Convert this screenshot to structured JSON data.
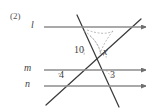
{
  "figure": {
    "problem_number": "(2)",
    "colors": {
      "parallel_line": "#8c8c8c",
      "transversal": "#3c3c3c",
      "arc": "#9a9a9a",
      "text": "#3f3f3f",
      "background": "#ffffff"
    },
    "parallel_lines": [
      {
        "name": "l",
        "label": "l",
        "y": 27,
        "x_start": 44,
        "x_end": 146,
        "arrow": "right"
      },
      {
        "name": "m",
        "label": "m",
        "y": 70,
        "x_start": 44,
        "x_end": 146,
        "arrow": "right"
      },
      {
        "name": "n",
        "label": "n",
        "y": 86,
        "x_start": 44,
        "x_end": 146,
        "arrow": "right"
      }
    ],
    "transversals": [
      {
        "name": "transversal-left",
        "x1": 77,
        "y1": 15,
        "x2": 119,
        "y2": 107,
        "direction": "down-right"
      },
      {
        "name": "transversal-right",
        "x1": 46,
        "y1": 105,
        "x2": 141,
        "y2": 19,
        "direction": "up-right"
      }
    ],
    "angle_labels": [
      {
        "name": "angle-10",
        "text": "10",
        "x": 74,
        "y": 45,
        "italic": false
      },
      {
        "name": "angle-x",
        "text": "x",
        "x": 103,
        "y": 47,
        "italic": true
      },
      {
        "name": "angle-4",
        "text": "4",
        "x": 59,
        "y": 70,
        "italic": false
      },
      {
        "name": "angle-3",
        "text": "3",
        "x": 110,
        "y": 70,
        "italic": false
      }
    ],
    "line_label_positions": [
      {
        "name": "line-label-l",
        "x": 31,
        "y": 20
      },
      {
        "name": "line-label-m",
        "x": 25,
        "y": 63
      },
      {
        "name": "line-label-n",
        "x": 26,
        "y": 79
      }
    ],
    "arcs": [
      {
        "name": "arc-dashed-vertex-left",
        "d": "M 84 31 Q 96 38 101 53",
        "style": "dashed"
      },
      {
        "name": "arc-dashed-vertex-left-outer",
        "d": "M 87 30 Q 104 36 113 31",
        "style": "dashed"
      },
      {
        "name": "arc-dashed-vertex-right",
        "d": "M 113 31 Q 104 42 100 54",
        "style": "dashed"
      },
      {
        "name": "arc-dashed-inner",
        "d": "M 90 36 Q 99 44 100 52",
        "style": "dashed"
      },
      {
        "name": "arc-angle-10",
        "d": "M 82 46 Q 85 50 84 55",
        "style": "dashed"
      },
      {
        "name": "arc-angle-x",
        "d": "M 100 52 Q 104 57 107 57",
        "style": "dashed"
      },
      {
        "name": "arc-angle-4",
        "d": "M 58 74 Q 62 73 64 70",
        "style": "dashed"
      },
      {
        "name": "arc-angle-3",
        "d": "M 106 70 Q 110 76 114 77",
        "style": "dashed"
      }
    ]
  }
}
